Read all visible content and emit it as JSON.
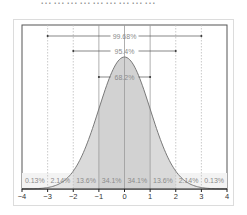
{
  "header": {
    "cut_text": "………………………"
  },
  "chart_data": {
    "type": "area",
    "xlabel": "",
    "ylabel": "",
    "xlim": [
      -4,
      4
    ],
    "x_ticks": [
      "-4",
      "-3",
      "-2",
      "-1",
      "0",
      "1",
      "2",
      "3",
      "4"
    ],
    "grid": "vertical dotted at each integer",
    "band_labels": [
      {
        "range": [
          -4,
          -3
        ],
        "label": "0.13%"
      },
      {
        "range": [
          -3,
          -2
        ],
        "label": "2.14%"
      },
      {
        "range": [
          -2,
          -1
        ],
        "label": "13.6%"
      },
      {
        "range": [
          -1,
          0
        ],
        "label": "34.1%"
      },
      {
        "range": [
          0,
          1
        ],
        "label": "34.1%"
      },
      {
        "range": [
          1,
          2
        ],
        "label": "13.6%"
      },
      {
        "range": [
          2,
          3
        ],
        "label": "2.14%"
      },
      {
        "range": [
          3,
          4
        ],
        "label": "0.13%"
      }
    ],
    "spans": [
      {
        "range": [
          -3,
          3
        ],
        "label": "99.68%"
      },
      {
        "range": [
          -2,
          2
        ],
        "label": "95.4%"
      },
      {
        "range": [
          -1,
          1
        ],
        "label": "68.2%"
      }
    ],
    "colors": {
      "fill_outer": "#e4e4e4",
      "fill_inner": "#d2d2d2",
      "curve": "#7a7a7a",
      "grid": "#bdbdbd"
    }
  }
}
